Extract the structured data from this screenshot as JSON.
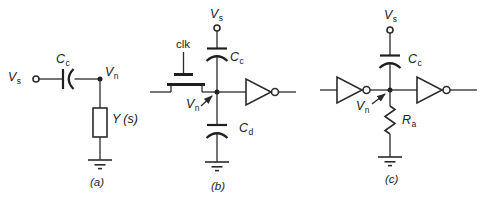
{
  "page": {
    "background": "#ffffff",
    "ink": "#2b2b2b"
  },
  "panels": {
    "a": {
      "caption": "(a)",
      "labels": {
        "vs": {
          "base": "V",
          "sub": "s"
        },
        "cc": {
          "base": "C",
          "sub": "c"
        },
        "vn": {
          "base": "V",
          "sub": "n"
        },
        "admittance": {
          "base": "Y",
          "suffix": "(s)"
        }
      }
    },
    "b": {
      "caption": "(b)",
      "labels": {
        "vs": {
          "base": "V",
          "sub": "s"
        },
        "clk": "clk",
        "cc": {
          "base": "C",
          "sub": "c"
        },
        "vn": {
          "base": "V",
          "sub": "n"
        },
        "cd": {
          "base": "C",
          "sub": "d"
        }
      }
    },
    "c": {
      "caption": "(c)",
      "labels": {
        "vs": {
          "base": "V",
          "sub": "s"
        },
        "cc": {
          "base": "C",
          "sub": "c"
        },
        "vn": {
          "base": "V",
          "sub": "n"
        },
        "ra": {
          "base": "R",
          "sub": "a"
        }
      }
    }
  }
}
